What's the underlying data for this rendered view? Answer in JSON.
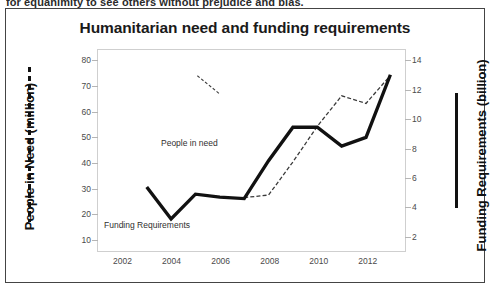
{
  "page": {
    "top_cropped_text": "for equanimity to see others without prejudice and bias."
  },
  "figure": {
    "title": "Humanitarian need and funding requirements",
    "left_axis_title": "People in Need (million)",
    "right_axis_title": "Funding Requirements (billion)",
    "series_label_people": "People in need",
    "series_label_funding": "Funding Requirements"
  },
  "chart_data": {
    "type": "line",
    "title": "Humanitarian need and funding requirements",
    "xlabel": "",
    "ylabel": "People in Need (million)",
    "y2label": "Funding Requirements (billion)",
    "xlim": [
      2001,
      2013.6
    ],
    "ylim": [
      5,
      84
    ],
    "y2lim": [
      0.9,
      14.7
    ],
    "grid": false,
    "legend": "inline-annotations",
    "xticks": [
      2002,
      2004,
      2006,
      2008,
      2010,
      2012
    ],
    "yticks": [
      10,
      20,
      30,
      40,
      50,
      60,
      70,
      80
    ],
    "y2ticks": [
      2,
      4,
      6,
      8,
      10,
      12,
      14
    ],
    "series": [
      {
        "name": "People in need",
        "axis": "left",
        "style": "dashed-thin",
        "color": "#3a3a3a",
        "x": [
          2007,
          2008,
          2009,
          2010,
          2011,
          2012,
          2013
        ],
        "values": [
          26,
          27,
          40,
          54,
          66,
          63,
          74
        ]
      },
      {
        "name": "Funding Requirements",
        "axis": "right",
        "style": "solid-thick",
        "color": "#111111",
        "x": [
          2003,
          2004,
          2005,
          2006,
          2007,
          2008,
          2009,
          2010,
          2011,
          2012,
          2013
        ],
        "values": [
          5.3,
          3.1,
          4.8,
          4.6,
          4.5,
          7.1,
          9.4,
          9.4,
          8.1,
          8.7,
          13.0
        ]
      }
    ]
  }
}
